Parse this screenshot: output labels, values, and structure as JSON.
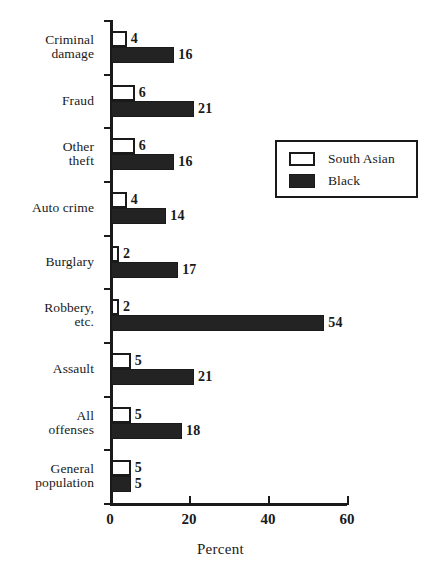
{
  "chart_data": {
    "type": "bar",
    "orientation": "horizontal",
    "title": "",
    "xlabel": "Percent",
    "ylabel": "",
    "xlim": [
      0,
      60
    ],
    "xticks": [
      0,
      20,
      40,
      60
    ],
    "grid": false,
    "legend_position": "upper right",
    "categories": [
      "Criminal\ndamage",
      "Fraud",
      "Other\ntheft",
      "Auto crime",
      "Burglary",
      "Robbery,\netc.",
      "Assault",
      "All\noffenses",
      "General\npopulation"
    ],
    "series": [
      {
        "name": "South Asian",
        "color": "#ffffff",
        "edgecolor": "#1a1a1a",
        "values": [
          4,
          6,
          6,
          4,
          2,
          2,
          5,
          5,
          5
        ]
      },
      {
        "name": "Black",
        "color": "#232323",
        "edgecolor": "#1a1a1a",
        "values": [
          16,
          21,
          16,
          14,
          17,
          54,
          21,
          18,
          5
        ]
      }
    ]
  },
  "legend": {
    "items": [
      {
        "label": "South Asian",
        "swatch": "light"
      },
      {
        "label": "Black",
        "swatch": "dark"
      }
    ]
  },
  "axis": {
    "x_title": "Percent",
    "x_tick_labels": [
      "0",
      "20",
      "40",
      "60"
    ]
  },
  "caption": {
    "clipped_text": ""
  }
}
